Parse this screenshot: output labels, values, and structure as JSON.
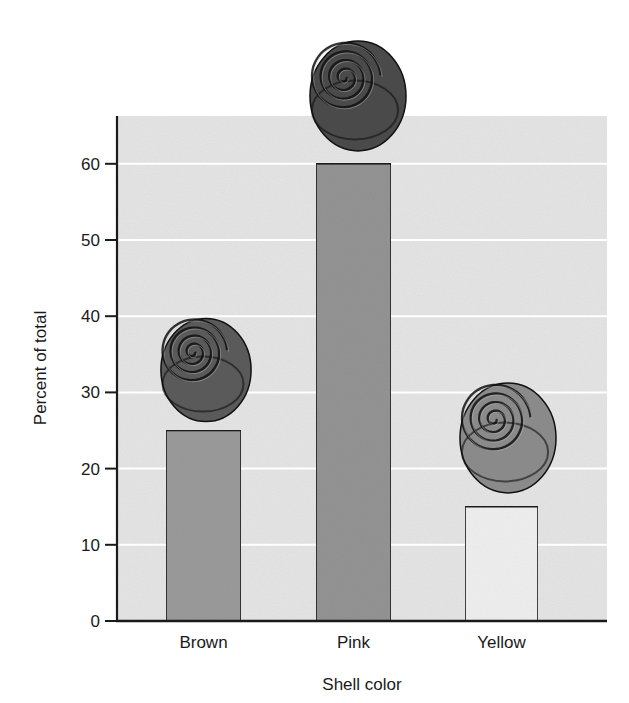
{
  "chart_data": {
    "type": "bar",
    "title": "",
    "xlabel": "Shell color",
    "ylabel": "Percent of total",
    "categories": [
      "Brown",
      "Pink",
      "Yellow"
    ],
    "values": [
      25,
      60,
      15
    ],
    "ylim": [
      0,
      66
    ],
    "yticks": [
      0,
      10,
      20,
      30,
      40,
      50,
      60
    ],
    "grid": true,
    "legend": null,
    "annotations": [
      "snail-shell illustration above each bar, shaded to match shell color"
    ]
  },
  "colors": {
    "plot_background": "#e4e4e4",
    "gridline": "#ffffff",
    "bar_fills": [
      "#9a9a9a",
      "#939393",
      "#eeeeee"
    ],
    "bar_stroke": "#1a1a1a",
    "axis": "#1a1a1a",
    "snail_tones": [
      "#5a5a5a",
      "#4a4a4a",
      "#8a8a8a"
    ]
  }
}
